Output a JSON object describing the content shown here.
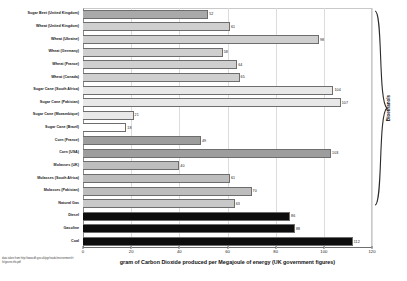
{
  "chart_data": {
    "type": "bar",
    "orientation": "horizontal",
    "title": "",
    "xlabel": "gram of Carbon Dioxide produced per Megajoule of energy (UK government figures)",
    "ylabel": "",
    "xlim": [
      0,
      120
    ],
    "xticks": [
      0,
      20,
      40,
      60,
      80,
      100,
      120
    ],
    "grid": true,
    "legend": false,
    "categories": [
      "Sugar Beet (United Kingdom)",
      "Wheat (United Kingdom)",
      "Wheat (Ukraine)",
      "Wheat (Germany)",
      "Wheat (France)",
      "Wheat (Canada)",
      "Sugar Cane (South Africa)",
      "Sugar Cane (Pakistan)",
      "Sugar Cane (Mozambique)",
      "Sugar Cane (Brazil)",
      "Corn (France)",
      "Corn (USA)",
      "Molasses (UK)",
      "Molasses (South Africa)",
      "Molasses (Pakistan)",
      "Natural Gas",
      "Diesel",
      "Gasoline",
      "Coal"
    ],
    "values": [
      52,
      61,
      98,
      58,
      64,
      65,
      104,
      107,
      21,
      18,
      49,
      103,
      40,
      61,
      70,
      63,
      86,
      88,
      112
    ],
    "bar_colors": [
      "#a9a9a9",
      "#cfcfcf",
      "#cfcfcf",
      "#cfcfcf",
      "#cfcfcf",
      "#cfcfcf",
      "#e8e8e8",
      "#e8e8e8",
      "#e8e8e8",
      "#ffffff",
      "#9d9d9d",
      "#9d9d9d",
      "#bdbdbd",
      "#bdbdbd",
      "#bdbdbd",
      "#c8c8c8",
      "#0d0d0d",
      "#0d0d0d",
      "#0d0d0d"
    ],
    "annotations": [
      {
        "text": "Bioethanols",
        "orientation": "vertical",
        "covers": "Sugar Beet (United Kingdom) through Molasses (Pakistan)"
      }
    ],
    "source_note": "data taken from http://www.dft.gov.uk/pgr/roads/environment/rtfo/govrecrtfo.pdf"
  },
  "axis": {
    "x_title": "gram of Carbon Dioxide produced per Megajoule of energy (UK government figures)",
    "ticks": [
      "0",
      "20",
      "40",
      "60",
      "80",
      "100",
      "120"
    ]
  },
  "bracket": {
    "label": "Bioethanols"
  },
  "footer": {
    "source": "data taken from http://www.dft.gov.uk/pgr/roads/environment/rtfo/govrecrtfo.pdf"
  }
}
